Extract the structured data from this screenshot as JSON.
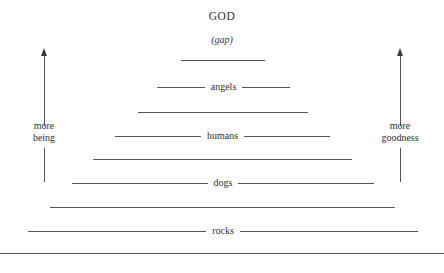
{
  "diagram": {
    "title_top": "GOD",
    "gap_label": "(gap)",
    "line_color": "#565656",
    "text_color": "#2f2f2f",
    "background": "#ffffff"
  },
  "axes": {
    "left": {
      "label_line1": "more",
      "label_line2": "being",
      "direction": "up"
    },
    "right": {
      "label_line1": "more",
      "label_line2": "goodness",
      "direction": "up"
    }
  },
  "rows": [
    {
      "label": "",
      "left": 181,
      "right": 265,
      "top": 60
    },
    {
      "label": "angels",
      "left": 157,
      "right": 290,
      "top": 87
    },
    {
      "label": "",
      "left": 138,
      "right": 308,
      "top": 112
    },
    {
      "label": "humans",
      "left": 115,
      "right": 330,
      "top": 136
    },
    {
      "label": "",
      "left": 93,
      "right": 352,
      "top": 159
    },
    {
      "label": "dogs",
      "left": 72,
      "right": 374,
      "top": 183
    },
    {
      "label": "",
      "left": 50,
      "right": 395,
      "top": 207
    },
    {
      "label": "rocks",
      "left": 28,
      "right": 418,
      "top": 231
    },
    {
      "label": "",
      "left": 0,
      "right": 444,
      "top": 253
    }
  ],
  "chart_data": {
    "type": "diagram",
    "title": "GOD",
    "subtitle": "(gap)",
    "categories": [
      "angels",
      "humans",
      "dogs",
      "rocks"
    ],
    "ylabel_left": "more being",
    "ylabel_right": "more goodness",
    "note": "Inverted pyramid / hierarchy of being: widest at the bottom (rocks), narrowing upward toward GOD at the apex."
  }
}
